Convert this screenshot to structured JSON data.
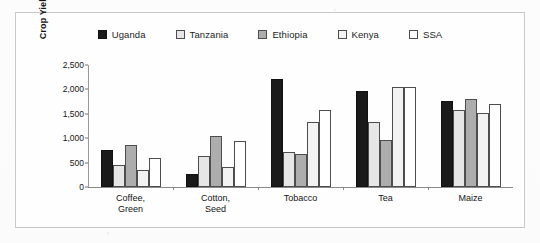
{
  "chart_data": {
    "type": "bar",
    "title": "",
    "xlabel": "",
    "ylabel": "Crop Yield (kg/ha)",
    "categories": [
      "Coffee,\nGreen",
      "Cotton,\nSeed",
      "Tobacco",
      "Tea",
      "Maize"
    ],
    "series": [
      {
        "name": "Uganda",
        "values": [
          760,
          270,
          2220,
          1960,
          1770
        ],
        "fill": "#1a1a1a",
        "stroke": "#111111"
      },
      {
        "name": "Tanzania",
        "values": [
          450,
          630,
          720,
          1340,
          1580
        ],
        "fill": "#e6e6e6",
        "stroke": "#4d4d4d"
      },
      {
        "name": "Ethiopia",
        "values": [
          860,
          1040,
          670,
          970,
          1800
        ],
        "fill": "#adadad",
        "stroke": "#4d4d4d"
      },
      {
        "name": "Kenya",
        "values": [
          340,
          400,
          1330,
          2050,
          1520
        ],
        "fill": "#f2f2f2",
        "stroke": "#4d4d4d"
      },
      {
        "name": "SSA",
        "values": [
          590,
          950,
          1570,
          2050,
          1700
        ],
        "fill": "#ffffff",
        "stroke": "#4d4d4d"
      }
    ],
    "ylim": [
      0,
      2500
    ],
    "yticks": [
      0,
      500,
      1000,
      1500,
      2000,
      2500
    ],
    "ytick_labels": [
      "0",
      "500",
      "1,000",
      "1,500",
      "2,000",
      "2,500"
    ],
    "grid": false,
    "legend_position": "top-center"
  },
  "legend": {
    "items": [
      {
        "label": "Uganda"
      },
      {
        "label": "Tanzania"
      },
      {
        "label": "Ethiopia"
      },
      {
        "label": "Kenya"
      },
      {
        "label": "SSA"
      }
    ]
  }
}
